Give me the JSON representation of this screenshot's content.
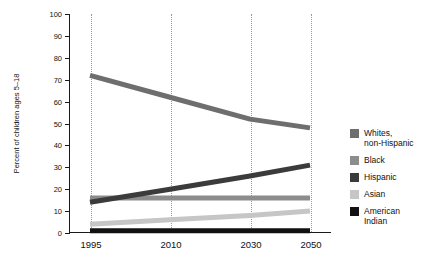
{
  "chart_data": {
    "type": "line",
    "title": "",
    "xlabel": "",
    "ylabel": "Percent of children ages 5–18",
    "x": [
      1995,
      2010,
      2030,
      2050
    ],
    "xlim": [
      1990,
      2055
    ],
    "ylim": [
      0,
      100
    ],
    "yticks": [
      0,
      10,
      20,
      30,
      40,
      50,
      60,
      70,
      80,
      90,
      100
    ],
    "xticks": [
      "1995",
      "2010",
      "2030",
      "2050"
    ],
    "grid": "vertical-dotted",
    "legend_position": "right",
    "series": [
      {
        "name": "Whites, non-Hispanic",
        "color": "#6e6e6e",
        "values": [
          72,
          62,
          52,
          48
        ]
      },
      {
        "name": "Black",
        "color": "#8c8c8c",
        "values": [
          16,
          16,
          16,
          16
        ]
      },
      {
        "name": "Hispanic",
        "color": "#3b3b3b",
        "values": [
          14,
          20,
          26,
          31
        ]
      },
      {
        "name": "Asian",
        "color": "#c6c6c6",
        "values": [
          4,
          6,
          8,
          10
        ]
      },
      {
        "name": "American Indian",
        "color": "#111111",
        "values": [
          1,
          1,
          1,
          1
        ]
      }
    ]
  },
  "axis": {
    "y_title": "Percent of children ages 5–18",
    "y_ticks": [
      "100",
      "90",
      "80",
      "70",
      "60",
      "50",
      "40",
      "30",
      "20",
      "10",
      "0"
    ],
    "x_ticks": [
      "1995",
      "2010",
      "2030",
      "2050"
    ]
  },
  "legend": {
    "items": [
      {
        "label": "Whites,\nnon-Hispanic",
        "line1": "Whites,",
        "line2": "non-Hispanic",
        "color": "#6e6e6e"
      },
      {
        "label": "Black",
        "line1": "Black",
        "line2": "",
        "color": "#8c8c8c"
      },
      {
        "label": "Hispanic",
        "line1": "Hispanic",
        "line2": "",
        "color": "#3b3b3b"
      },
      {
        "label": "Asian",
        "line1": "Asian",
        "line2": "",
        "color": "#c6c6c6"
      },
      {
        "label": "American\nIndian",
        "line1": "American",
        "line2": "Indian",
        "color": "#111111"
      }
    ]
  }
}
